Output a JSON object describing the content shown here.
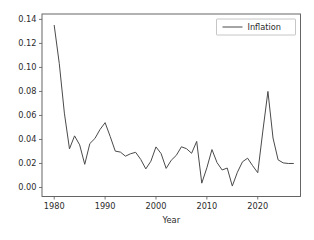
{
  "chart_data": {
    "type": "line",
    "title": "",
    "xlabel": "Year",
    "ylabel": "",
    "xlim": [
      1977.6,
      2028.4
    ],
    "ylim": [
      -0.0075,
      0.1445
    ],
    "grid": false,
    "legend_position": "upper right",
    "x": [
      1980,
      1981,
      1982,
      1983,
      1984,
      1985,
      1986,
      1987,
      1988,
      1989,
      1990,
      1991,
      1992,
      1993,
      1994,
      1995,
      1996,
      1997,
      1998,
      1999,
      2000,
      2001,
      2002,
      2003,
      2004,
      2005,
      2006,
      2007,
      2008,
      2009,
      2010,
      2011,
      2012,
      2013,
      2014,
      2015,
      2016,
      2017,
      2018,
      2019,
      2020,
      2021,
      2022,
      2023,
      2024,
      2025,
      2026,
      2027
    ],
    "series": [
      {
        "name": "Inflation",
        "color": "#4a4a4a",
        "values": [
          0.135,
          0.1031,
          0.0619,
          0.0322,
          0.043,
          0.0355,
          0.0193,
          0.0366,
          0.0408,
          0.0483,
          0.054,
          0.0425,
          0.0303,
          0.0295,
          0.0261,
          0.0281,
          0.0293,
          0.0234,
          0.0155,
          0.0219,
          0.0338,
          0.0283,
          0.0159,
          0.0227,
          0.0268,
          0.0339,
          0.0323,
          0.0285,
          0.0384,
          0.0036,
          0.0164,
          0.0316,
          0.0207,
          0.0146,
          0.0162,
          0.0012,
          0.0127,
          0.0214,
          0.0244,
          0.0181,
          0.0123,
          0.047,
          0.08,
          0.0412,
          0.023,
          0.0205,
          0.02,
          0.02
        ]
      }
    ],
    "xticks": [
      1980,
      1990,
      2000,
      2010,
      2020
    ],
    "xticklabels": [
      "1980",
      "1990",
      "2000",
      "2010",
      "2020"
    ],
    "yticks": [
      0.0,
      0.02,
      0.04,
      0.06,
      0.08,
      0.1,
      0.12,
      0.14
    ],
    "yticklabels": [
      "0.00",
      "0.02",
      "0.04",
      "0.06",
      "0.08",
      "0.10",
      "0.12",
      "0.14"
    ],
    "legend_entries": [
      "Inflation"
    ]
  },
  "figure": {
    "background_color": "#ffffff",
    "axes_background_color": "#ffffff",
    "spine_color": "#555555"
  }
}
